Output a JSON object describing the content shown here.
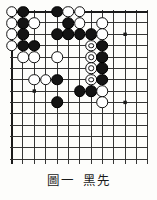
{
  "figure": {
    "caption_label": "圖一",
    "caption_text": "黑先",
    "type": "go-problem-diagram"
  },
  "board": {
    "columns": 13,
    "rows": 10,
    "edges_shown": [
      "top",
      "left"
    ],
    "line_color": "#2b2b2b",
    "border_color": "#1a1a1a",
    "background_color": "#fdfdfb",
    "star_points": [
      {
        "col": 11,
        "row": 3
      },
      {
        "col": 3,
        "row": 8
      },
      {
        "col": 11,
        "row": 9
      }
    ],
    "black_color": "#141414",
    "white_color": "#ffffff",
    "stones": [
      {
        "col": 1,
        "row": 1,
        "color": "white",
        "marked": false
      },
      {
        "col": 2,
        "row": 1,
        "color": "black",
        "marked": false
      },
      {
        "col": 5,
        "row": 1,
        "color": "black",
        "marked": false
      },
      {
        "col": 6,
        "row": 1,
        "color": "white",
        "marked": false
      },
      {
        "col": 7,
        "row": 1,
        "color": "white",
        "marked": false
      },
      {
        "col": 1,
        "row": 2,
        "color": "white",
        "marked": false
      },
      {
        "col": 2,
        "row": 2,
        "color": "black",
        "marked": false
      },
      {
        "col": 3,
        "row": 2,
        "color": "white",
        "marked": false
      },
      {
        "col": 6,
        "row": 2,
        "color": "black",
        "marked": false
      },
      {
        "col": 7,
        "row": 2,
        "color": "white",
        "marked": false
      },
      {
        "col": 9,
        "row": 2,
        "color": "white",
        "marked": false
      },
      {
        "col": 1,
        "row": 3,
        "color": "white",
        "marked": false
      },
      {
        "col": 2,
        "row": 3,
        "color": "black",
        "marked": false
      },
      {
        "col": 5,
        "row": 3,
        "color": "black",
        "marked": false
      },
      {
        "col": 6,
        "row": 3,
        "color": "black",
        "marked": false
      },
      {
        "col": 7,
        "row": 3,
        "color": "black",
        "marked": false
      },
      {
        "col": 8,
        "row": 3,
        "color": "black",
        "marked": false
      },
      {
        "col": 9,
        "row": 3,
        "color": "white",
        "marked": false
      },
      {
        "col": 1,
        "row": 4,
        "color": "white",
        "marked": false
      },
      {
        "col": 2,
        "row": 4,
        "color": "black",
        "marked": false
      },
      {
        "col": 3,
        "row": 4,
        "color": "black",
        "marked": false
      },
      {
        "col": 8,
        "row": 4,
        "color": "white",
        "marked": true
      },
      {
        "col": 9,
        "row": 4,
        "color": "black",
        "marked": false
      },
      {
        "col": 2,
        "row": 5,
        "color": "white",
        "marked": false
      },
      {
        "col": 3,
        "row": 5,
        "color": "white",
        "marked": false
      },
      {
        "col": 5,
        "row": 5,
        "color": "white",
        "marked": false
      },
      {
        "col": 8,
        "row": 5,
        "color": "white",
        "marked": true
      },
      {
        "col": 9,
        "row": 5,
        "color": "black",
        "marked": false
      },
      {
        "col": 8,
        "row": 6,
        "color": "white",
        "marked": true
      },
      {
        "col": 9,
        "row": 6,
        "color": "black",
        "marked": false
      },
      {
        "col": 3,
        "row": 7,
        "color": "white",
        "marked": false
      },
      {
        "col": 4,
        "row": 7,
        "color": "white",
        "marked": false
      },
      {
        "col": 5,
        "row": 7,
        "color": "black",
        "marked": false
      },
      {
        "col": 8,
        "row": 7,
        "color": "white",
        "marked": true
      },
      {
        "col": 9,
        "row": 7,
        "color": "black",
        "marked": false
      },
      {
        "col": 7,
        "row": 8,
        "color": "black",
        "marked": false
      },
      {
        "col": 8,
        "row": 8,
        "color": "black",
        "marked": false
      },
      {
        "col": 9,
        "row": 8,
        "color": "white",
        "marked": false
      },
      {
        "col": 5,
        "row": 9,
        "color": "black",
        "marked": false
      },
      {
        "col": 9,
        "row": 9,
        "color": "white",
        "marked": false
      }
    ]
  }
}
